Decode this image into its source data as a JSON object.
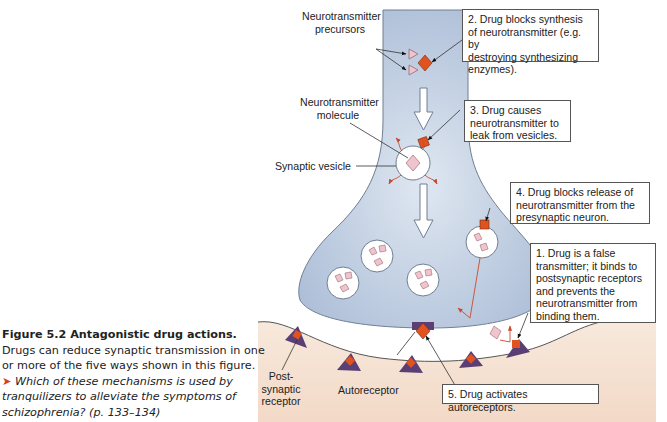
{
  "caption": {
    "title": "Figure 5.2 Antagonistic drug actions.",
    "body": " Drugs can reduce synaptic transmission in one or more of the five ways shown in this figure.",
    "question_marker": "➤",
    "question": " Which of these mechanisms is used by tranquilizers to alleviate the symptoms of schizophrenia? (p. 133–134)"
  },
  "labels": {
    "precursors_line1": "Neurotransmitter",
    "precursors_line2": "precursors",
    "molecule_line1": "Neurotransmitter",
    "molecule_line2": "molecule",
    "vesicle": "Synaptic vesicle",
    "postsynaptic_line1": "Post-",
    "postsynaptic_line2": "synaptic",
    "postsynaptic_line3": "receptor",
    "autoreceptor": "Autoreceptor"
  },
  "callouts": [
    {
      "id": "2",
      "lines": [
        "2. Drug blocks synthesis",
        "of neurotransmitter (e.g. by",
        "destroying synthesizing",
        "enzymes)."
      ]
    },
    {
      "id": "3",
      "lines": [
        "3. Drug causes",
        "neurotransmitter to",
        "leak from vesicles."
      ]
    },
    {
      "id": "4",
      "lines": [
        "4. Drug blocks release of",
        "neurotransmitter from the",
        "presynaptic neuron."
      ]
    },
    {
      "id": "1",
      "lines": [
        "1. Drug is a false",
        "transmitter; it binds to",
        "postsynaptic receptors",
        "and prevents the",
        "neurotransmitter from",
        "binding them."
      ]
    },
    {
      "id": "5",
      "lines": [
        "5. Drug activates autoreceptors."
      ]
    }
  ],
  "colors": {
    "neuron_fill": "#b9c9df",
    "neuron_stroke": "#6f7f93",
    "postsynaptic_fill": "#f5e3d4",
    "drug": "#e0531f",
    "neurotransmitter": "#efc4cc",
    "receptor": "#5b3f74",
    "leak_arrow": "#c94a2c"
  }
}
